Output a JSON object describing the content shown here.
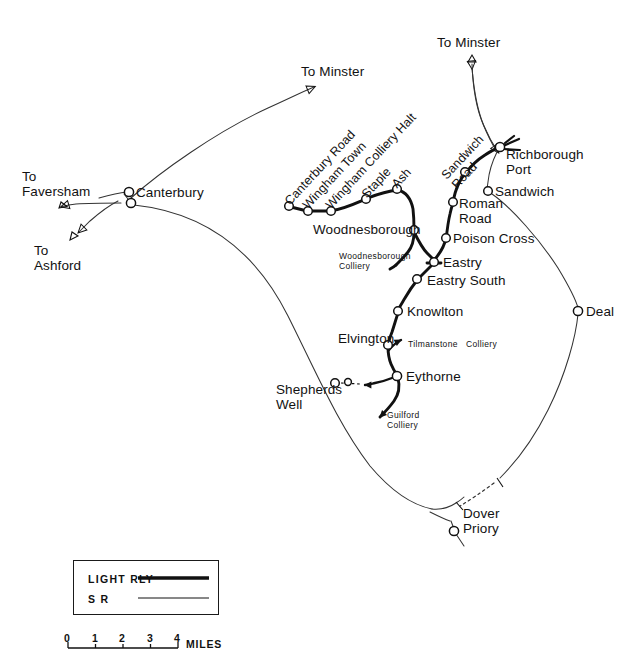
{
  "figure": {
    "kind": "railway-route-diagram",
    "background_color": "#ffffff",
    "ink_color": "#111111"
  },
  "stations": {
    "canterbury": "Canterbury",
    "canterbury_road": "Canterbury Road",
    "wingham_town": "Wingham Town",
    "wingham_colliery_halt": "Wingham Colliery Halt",
    "staple": "Staple",
    "ash": "Ash",
    "woodnesborough": "Woodnesborough",
    "sandwich_road": "Sandwich\nRoad",
    "richborough_port": "Richborough\nPort",
    "sandwich": "Sandwich",
    "roman_road": "Roman\nRoad",
    "poison_cross": "Poison Cross",
    "eastry": "Eastry",
    "eastry_south": "Eastry South",
    "knowlton": "Knowlton",
    "elvington": "Elvington",
    "eythorne": "Eythorne",
    "shepherds_well": "Shepherds\nWell",
    "deal": "Deal",
    "dover_priory": "Dover\nPriory"
  },
  "collieries": {
    "woodnesborough_colliery": "Woodnesborough\nColliery",
    "tilmanstone_colliery": "Tilmanstone   Colliery",
    "guilford_colliery": "Guilford\nColliery"
  },
  "offmap_arrows": {
    "to_minster_west": "To Minster",
    "to_minster_north": "To Minster",
    "to_faversham": "To\nFaversham",
    "to_ashford": "To\nAshford"
  },
  "legend": {
    "title": "",
    "items": [
      {
        "label": "LIGHT RLY",
        "style": "thick"
      },
      {
        "label": "S R",
        "style": "thin"
      }
    ]
  },
  "scale": {
    "ticks": [
      "0",
      "1",
      "2",
      "3",
      "4"
    ],
    "unit": "MILES"
  }
}
